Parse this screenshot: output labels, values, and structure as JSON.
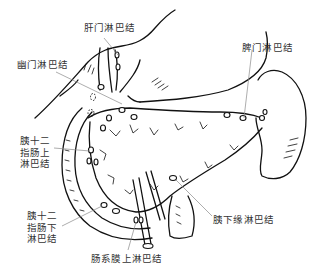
{
  "figure": {
    "line_color": "#111111",
    "leader_color": "#8a8a8a",
    "label_color": "#333333",
    "background": "#ffffff"
  },
  "labels": {
    "hepatic_hilum": "肝门淋巴结",
    "pyloric": "幽门淋巴结",
    "splenic_hilum": "脾门淋巴结",
    "supraduodenal": "胰十二\n指肠上\n淋巴结",
    "infraduodenal": "胰十二\n指肠下\n淋巴结",
    "inferior_pancreatic": "胰下缘淋巴结",
    "superior_mesenteric": "肠系膜上淋巴结"
  }
}
